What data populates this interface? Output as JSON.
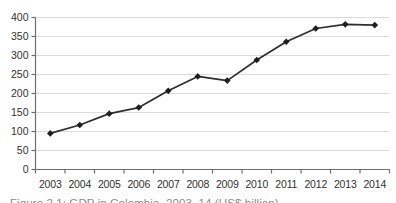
{
  "figure": {
    "caption": "Figure 2.1: GDP in Colombia, 2003–14 (US$ billion)"
  },
  "chart_data": {
    "type": "line",
    "title": "",
    "xlabel": "",
    "ylabel": "",
    "categories": [
      "2003",
      "2004",
      "2005",
      "2006",
      "2007",
      "2008",
      "2009",
      "2010",
      "2011",
      "2012",
      "2013",
      "2014"
    ],
    "series": [
      {
        "name": "GDP (US$ billion)",
        "values": [
          95,
          117,
          147,
          163,
          207,
          245,
          234,
          288,
          336,
          371,
          382,
          380
        ]
      }
    ],
    "ylim": [
      0,
      400
    ],
    "yticks": [
      0,
      50,
      100,
      150,
      200,
      250,
      300,
      350,
      400
    ],
    "grid": true,
    "legend_position": "none",
    "marker": "diamond",
    "colors": {
      "line": "#2e2e2e",
      "marker": "#1f1f1f",
      "gridline": "#dcdcdc",
      "axis": "#6e6e6e",
      "tick_label": "#303030",
      "caption": "#8c8c8c",
      "background": "#ffffff"
    }
  }
}
